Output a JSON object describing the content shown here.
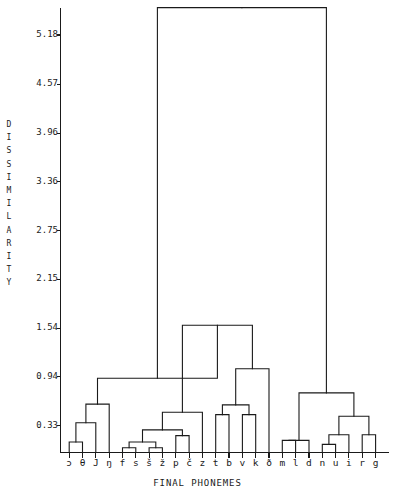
{
  "figure": {
    "kind": "dendrogram",
    "background": "#ffffff",
    "line_color": "#1a1a1a"
  },
  "axes": {
    "y_axis_title_chars": [
      "D",
      "I",
      "S",
      "S",
      "I",
      "M",
      "I",
      "L",
      "A",
      "R",
      "I",
      "T",
      "Y"
    ],
    "y_axis_title": "DISSIMILARITY",
    "x_axis_title": "FINAL PHONEMES"
  },
  "chart_data": {
    "type": "line",
    "subtype": "dendrogram",
    "title": "",
    "xlabel": "FINAL PHONEMES",
    "ylabel": "DISSIMILARITY",
    "orientation": "vertical",
    "grid": false,
    "legend": null,
    "ylim": [
      0.0,
      5.6
    ],
    "ytick_labels": [
      "5.18",
      "4.57",
      "3.96",
      "3.36",
      "2.75",
      "2.15",
      "1.54",
      "0.94",
      "0.33"
    ],
    "ytick_values": [
      5.18,
      4.57,
      3.96,
      3.36,
      2.75,
      2.15,
      1.54,
      0.94,
      0.33
    ],
    "leaf_labels": [
      "ɔ",
      "θ",
      "J",
      "ŋ",
      "f",
      "s",
      "š",
      "ž",
      "p",
      "č",
      "z",
      "t",
      "b",
      "v",
      "k",
      "ð",
      "m",
      "l",
      "d",
      "n",
      "u",
      "i",
      "r",
      "g"
    ],
    "n_leaves": 24,
    "merges": [
      {
        "id": "m1",
        "left": "ɔ",
        "right": "θ",
        "height": 0.13
      },
      {
        "id": "m2",
        "left": "m1",
        "right": "J",
        "height": 0.37
      },
      {
        "id": "m3",
        "left": "m2",
        "right": "ŋ",
        "height": 0.6
      },
      {
        "id": "m4",
        "left": "f",
        "right": "s",
        "height": 0.06
      },
      {
        "id": "m5",
        "left": "š",
        "right": "ž",
        "height": 0.06
      },
      {
        "id": "m6",
        "left": "m4",
        "right": "m5",
        "height": 0.13
      },
      {
        "id": "m7",
        "left": "p",
        "right": "č",
        "height": 0.21
      },
      {
        "id": "m8",
        "left": "m6",
        "right": "m7",
        "height": 0.28
      },
      {
        "id": "m9",
        "left": "m8",
        "right": "z",
        "height": 0.5
      },
      {
        "id": "m10",
        "left": "t",
        "right": "b",
        "height": 0.47
      },
      {
        "id": "m11",
        "left": "v",
        "right": "k",
        "height": 0.47
      },
      {
        "id": "m12",
        "left": "m10",
        "right": "m11",
        "height": 0.59
      },
      {
        "id": "m13",
        "left": "m12",
        "right": "ð",
        "height": 1.04
      },
      {
        "id": "m14",
        "left": "m9",
        "right": "m13",
        "height": 1.58
      },
      {
        "id": "m15",
        "left": "m3",
        "right": "m14",
        "height": 0.92
      },
      {
        "id": "m16",
        "left": "m",
        "right": "l",
        "height": 0.15
      },
      {
        "id": "m17",
        "left": "m16",
        "right": "d",
        "height": 0.15
      },
      {
        "id": "m18",
        "left": "n",
        "right": "u",
        "height": 0.1
      },
      {
        "id": "m19",
        "left": "r",
        "right": "g",
        "height": 0.22
      },
      {
        "id": "m20",
        "left": "m18",
        "right": "i",
        "height": 0.22
      },
      {
        "id": "m21",
        "left": "m20",
        "right": "m19",
        "height": 0.45
      },
      {
        "id": "m22",
        "left": "m17",
        "right": "m21",
        "height": 0.74
      },
      {
        "id": "m23",
        "left": "m15",
        "right": "m22",
        "height": 5.52
      }
    ]
  }
}
